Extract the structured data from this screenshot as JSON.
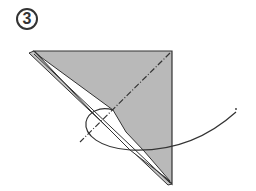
{
  "step": {
    "number": "3"
  },
  "colors": {
    "paper_fill": "#b9b9b9",
    "outline": "#333333",
    "inner_white": "#ffffff",
    "background": "#ffffff"
  }
}
